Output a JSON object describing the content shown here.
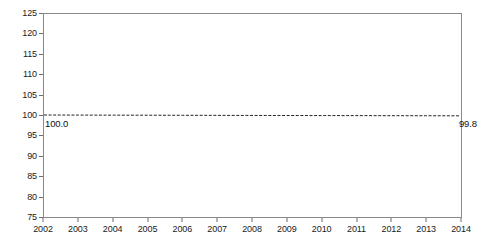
{
  "chart_data": {
    "type": "line",
    "title": "",
    "subtitle": "",
    "xlabel": "",
    "ylabel": "",
    "x": [
      2002,
      2003,
      2004,
      2005,
      2006,
      2007,
      2008,
      2009,
      2010,
      2011,
      2012,
      2013,
      2014
    ],
    "categories": [
      "2002",
      "2003",
      "2004",
      "2005",
      "2006",
      "2007",
      "2008",
      "2009",
      "2010",
      "2011",
      "2012",
      "2013",
      "2014"
    ],
    "values": [
      100.0,
      99.98,
      99.96,
      99.95,
      99.93,
      99.91,
      99.89,
      99.88,
      99.86,
      99.85,
      99.83,
      99.82,
      99.8
    ],
    "series": [
      {
        "name": "index",
        "values": [
          100.0,
          99.98,
          99.96,
          99.95,
          99.93,
          99.91,
          99.89,
          99.88,
          99.86,
          99.85,
          99.83,
          99.82,
          99.8
        ],
        "line_style": "dashed",
        "color": "#222222"
      }
    ],
    "xlim": [
      2002,
      2014
    ],
    "ylim": [
      75,
      125
    ],
    "ytick_step": 5,
    "yticks": [
      125,
      120,
      115,
      110,
      105,
      100,
      95,
      90,
      85,
      80,
      75
    ],
    "ytick_labels": [
      "125",
      "120",
      "115",
      "110",
      "105",
      "100",
      "95",
      "90",
      "85",
      "80",
      "75"
    ],
    "xticks": [
      2002,
      2003,
      2004,
      2005,
      2006,
      2007,
      2008,
      2009,
      2010,
      2011,
      2012,
      2013,
      2014
    ],
    "xtick_labels": [
      "2002",
      "2003",
      "2004",
      "2005",
      "2006",
      "2007",
      "2008",
      "2009",
      "2010",
      "2011",
      "2012",
      "2013",
      "2014"
    ],
    "grid": false,
    "legend": null,
    "annotations": [
      {
        "name": "start-value",
        "text": "100.0",
        "x": 2002,
        "y": 100.0
      },
      {
        "name": "end-value",
        "text": "99.8",
        "x": 2014,
        "y": 99.8
      }
    ],
    "frame_color": "#8a8a8a",
    "background": "#ffffff"
  }
}
